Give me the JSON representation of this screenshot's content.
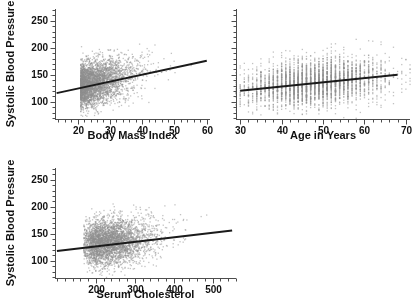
{
  "figure": {
    "background": "#ffffff",
    "point_color": "#8f8f8f",
    "line_color": "#1a1a1a",
    "axis_color": "#4d4d4d",
    "text_color": "#111111"
  },
  "chart_data": [
    {
      "id": "bmi-vs-sbp",
      "type": "scatter",
      "title": "",
      "xlabel": "Body Mass Index",
      "ylabel": "Systolic Blood Pressure",
      "xlim": [
        13,
        61
      ],
      "ylim": [
        68,
        272
      ],
      "xticks": [
        20,
        30,
        40,
        50,
        60
      ],
      "xticklabels": [
        "20",
        "30",
        "40",
        "50",
        "60"
      ],
      "xminor_step": 2,
      "yticks": [
        100,
        150,
        200,
        250
      ],
      "yticklabels": [
        "100",
        "150",
        "200",
        "250"
      ],
      "yminor_step": 10,
      "grid": false,
      "legend": "none",
      "n_points": 3400,
      "cloud": {
        "x_mean": 26.4,
        "x_sd": 4.6,
        "y_mean": 136.0,
        "y_sd": 21.5,
        "correlation": 0.3,
        "x_skew": 0.55
      },
      "fit_line": {
        "x_start": 13.5,
        "y_start": 116.0,
        "x_end": 60.0,
        "y_end": 176.0,
        "slope": 1.29,
        "intercept": 98.6
      }
    },
    {
      "id": "age-vs-sbp",
      "type": "scatter",
      "title": "",
      "xlabel": "Age in Years",
      "ylabel": "Systolic Blood Pressure",
      "xlim": [
        29,
        71
      ],
      "ylim": [
        68,
        272
      ],
      "xticks": [
        30,
        40,
        50,
        60,
        70
      ],
      "xticklabels": [
        "30",
        "40",
        "50",
        "60",
        "70"
      ],
      "xminor_step": 2,
      "yticks": [
        100,
        150,
        200,
        250
      ],
      "yticklabels": [
        "",
        "",
        "",
        ""
      ],
      "yminor_step": 10,
      "grid": false,
      "legend": "none",
      "n_points": 3400,
      "discrete_x": true,
      "cloud": {
        "x_mean": 48.0,
        "x_sd": 8.6,
        "y_mean": 136.0,
        "y_sd": 21.5,
        "correlation": 0.26,
        "x_skew": 0.0
      },
      "fit_line": {
        "x_start": 30.0,
        "y_start": 120.5,
        "x_end": 68.0,
        "y_end": 150.0,
        "slope": 0.78,
        "intercept": 97.2
      }
    },
    {
      "id": "cholesterol-vs-sbp",
      "type": "scatter",
      "title": "",
      "xlabel": "Serum Cholesterol",
      "ylabel": "Systolic Blood Pressure",
      "xlim": [
        95,
        560
      ],
      "ylim": [
        68,
        272
      ],
      "xticks": [
        200,
        300,
        400,
        500
      ],
      "xticklabels": [
        "200",
        "300",
        "400",
        "500"
      ],
      "xminor_step": 20,
      "yticks": [
        100,
        150,
        200,
        250
      ],
      "yticklabels": [
        "100",
        "150",
        "200",
        "250"
      ],
      "yminor_step": 10,
      "grid": false,
      "legend": "none",
      "n_points": 3400,
      "cloud": {
        "x_mean": 243.0,
        "x_sd": 46.0,
        "y_mean": 136.0,
        "y_sd": 21.5,
        "correlation": 0.17,
        "x_skew": 0.35
      },
      "fit_line": {
        "x_start": 100.0,
        "y_start": 118.0,
        "x_end": 550.0,
        "y_end": 156.0,
        "slope": 0.0844,
        "intercept": 109.6
      }
    }
  ]
}
